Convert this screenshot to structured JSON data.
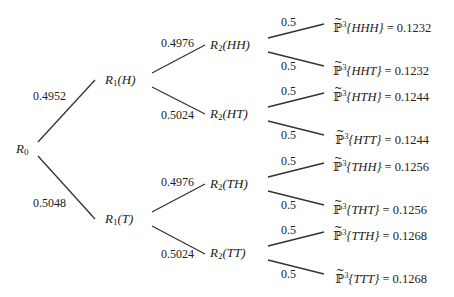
{
  "diagram": {
    "type": "binomial-tree",
    "root": {
      "label": "R",
      "sub": "0"
    },
    "level1": [
      {
        "label": "R",
        "sub": "1",
        "arg": "(H)",
        "edge_prob": "0.4952"
      },
      {
        "label": "R",
        "sub": "1",
        "arg": "(T)",
        "edge_prob": "0.5048"
      }
    ],
    "level2": [
      {
        "label": "R",
        "sub": "2",
        "arg": "(HH)",
        "edge_prob": "0.4976"
      },
      {
        "label": "R",
        "sub": "2",
        "arg": "(HT)",
        "edge_prob": "0.5024"
      },
      {
        "label": "R",
        "sub": "2",
        "arg": "(TH)",
        "edge_prob": "0.4976"
      },
      {
        "label": "R",
        "sub": "2",
        "arg": "(TT)",
        "edge_prob": "0.5024"
      }
    ],
    "leaves": [
      {
        "edge_prob": "0.5",
        "prob_symbol": "P",
        "power": "3",
        "outcome": "{HHH}",
        "value": "= 0.1232"
      },
      {
        "edge_prob": "0.5",
        "prob_symbol": "P",
        "power": "3",
        "outcome": "{HHT}",
        "value": "= 0.1232"
      },
      {
        "edge_prob": "0.5",
        "prob_symbol": "P",
        "power": "3",
        "outcome": "{HTH}",
        "value": "= 0.1244"
      },
      {
        "edge_prob": "0.5",
        "prob_symbol": "P",
        "power": "3",
        "outcome": "{HTT}",
        "value": "= 0.1244"
      },
      {
        "edge_prob": "0.5",
        "prob_symbol": "P",
        "power": "3",
        "outcome": "{THH}",
        "value": "= 0.1256"
      },
      {
        "edge_prob": "0.5",
        "prob_symbol": "P",
        "power": "3",
        "outcome": "{THT}",
        "value": "= 0.1256"
      },
      {
        "edge_prob": "0.5",
        "prob_symbol": "P",
        "power": "3",
        "outcome": "{TTH}",
        "value": "= 0.1268"
      },
      {
        "edge_prob": "0.5",
        "prob_symbol": "P",
        "power": "3",
        "outcome": "{TTT}",
        "value": "= 0.1268"
      }
    ]
  }
}
